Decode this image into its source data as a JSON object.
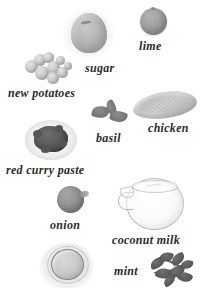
{
  "page": {
    "kind": "ingredient-layout-plate",
    "background_color": "#ffffff",
    "label_color": "#2b2b2b",
    "width": 212,
    "height": 288
  },
  "ingredients": [
    {
      "id": "sugar",
      "label": "sugar",
      "icon": "sugar-mound-icon",
      "color": "#b4b4b4",
      "label_x": 85,
      "label_y": 62,
      "art_x": 62,
      "art_y": 8
    },
    {
      "id": "lime",
      "label": "lime",
      "icon": "lime-fruit-icon",
      "color": "#969696",
      "label_x": 139,
      "label_y": 40,
      "art_x": 140,
      "art_y": 8
    },
    {
      "id": "new-potatoes",
      "label": "new potatoes",
      "icon": "potato-cluster-icon",
      "color": "#c8c8c8",
      "label_x": 8,
      "label_y": 87,
      "art_x": 23,
      "art_y": 52
    },
    {
      "id": "chicken",
      "label": "chicken",
      "icon": "chicken-breast-icon",
      "color": "#cbcbcb",
      "label_x": 148,
      "label_y": 122,
      "art_x": 133,
      "art_y": 92
    },
    {
      "id": "basil",
      "label": "basil",
      "icon": "basil-leaves-icon",
      "color": "#7c7c7c",
      "label_x": 96,
      "label_y": 132,
      "art_x": 92,
      "art_y": 100
    },
    {
      "id": "red-curry-paste",
      "label": "red curry paste",
      "icon": "curry-paste-dish-icon",
      "color": "#565656",
      "label_x": 6,
      "label_y": 164,
      "art_x": 25,
      "art_y": 120
    },
    {
      "id": "onion",
      "label": "onion",
      "icon": "onion-bulb-icon",
      "color": "#8b8b8b",
      "label_x": 50,
      "label_y": 219,
      "art_x": 57,
      "art_y": 186
    },
    {
      "id": "coconut-milk",
      "label": "coconut milk",
      "icon": "glass-jug-icon",
      "color": "#f4f4f4",
      "label_x": 112,
      "label_y": 234,
      "art_x": 118,
      "art_y": 178
    },
    {
      "id": "mint",
      "label": "mint",
      "icon": "mint-sprig-icon",
      "color": "#5a5a5a",
      "label_x": 114,
      "label_y": 265,
      "art_x": 150,
      "art_y": 252
    },
    {
      "id": "bowl",
      "label": "",
      "icon": "bowl-icon",
      "color": "#cfcfcf",
      "art_x": 42,
      "art_y": 243
    }
  ],
  "jug_script_text": "coconut"
}
